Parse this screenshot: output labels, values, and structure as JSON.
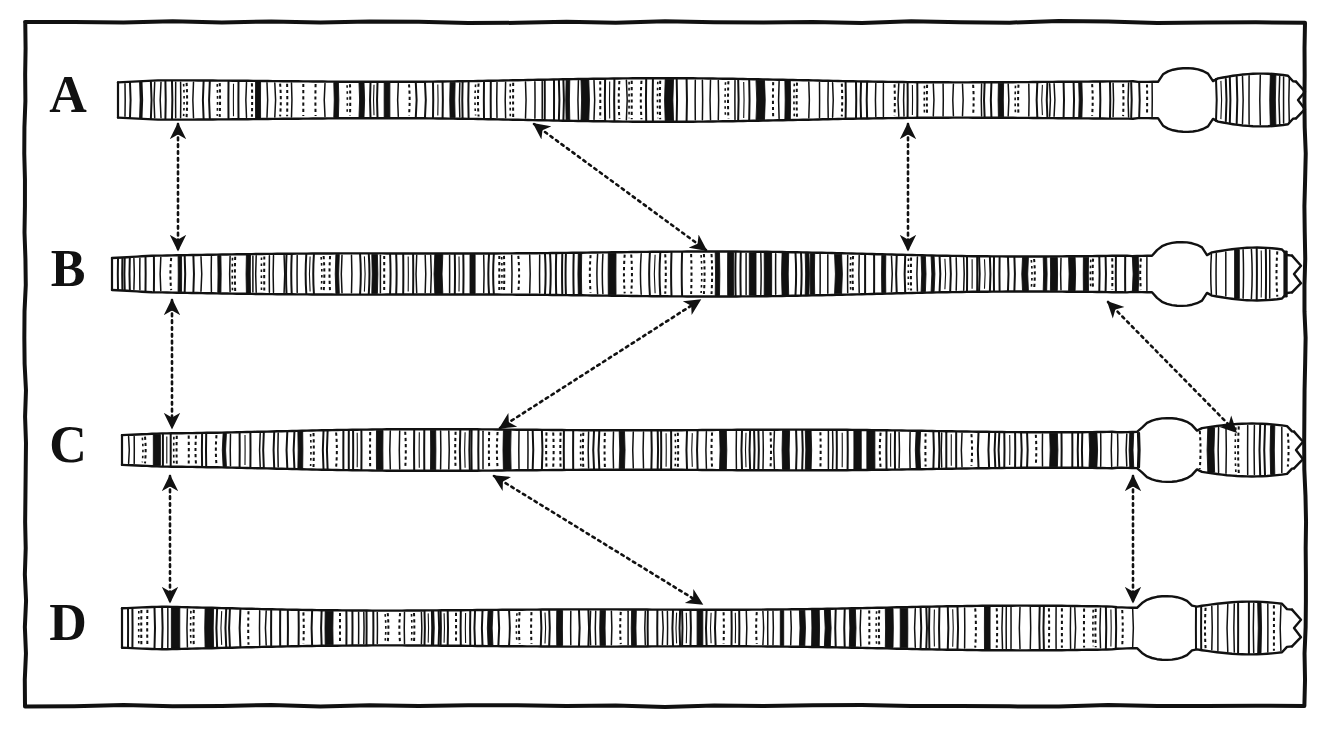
{
  "figure": {
    "background_color": "#ffffff",
    "ink_color": "#111111",
    "frame": {
      "name": "figure-border",
      "x": 25,
      "y": 22,
      "width": 1280,
      "height": 684,
      "stroke_width": 4
    }
  },
  "rows": [
    {
      "id": "A",
      "label": "A",
      "label_x": 68,
      "label_y": 100,
      "axis_y": 100,
      "x_start": 118,
      "x_end": 1296,
      "half_height": 21,
      "bulb_center": 1186,
      "bulb_radius": 27,
      "band_seed": 11
    },
    {
      "id": "B",
      "label": "B",
      "label_x": 68,
      "label_y": 274,
      "axis_y": 274,
      "x_start": 112,
      "x_end": 1292,
      "half_height": 21,
      "bulb_center": 1181,
      "bulb_radius": 26,
      "band_seed": 29
    },
    {
      "id": "C",
      "label": "C",
      "label_x": 68,
      "label_y": 450,
      "axis_y": 450,
      "x_start": 122,
      "x_end": 1294,
      "half_height": 21,
      "bulb_center": 1168,
      "bulb_radius": 27,
      "band_seed": 47
    },
    {
      "id": "D",
      "label": "D",
      "label_x": 68,
      "label_y": 628,
      "axis_y": 628,
      "x_start": 122,
      "x_end": 1292,
      "half_height": 21,
      "bulb_center": 1166,
      "bulb_radius": 27,
      "band_seed": 73
    }
  ],
  "connectors": [
    {
      "name": "connector-a-b-left",
      "kind": "vertical-double-arrow",
      "from_row": "A",
      "to_row": "B",
      "x1": 178,
      "y1": 124,
      "x2": 178,
      "y2": 250,
      "heads": "both"
    },
    {
      "name": "connector-b-c-left",
      "kind": "vertical-double-arrow",
      "from_row": "B",
      "to_row": "C",
      "x1": 172,
      "y1": 300,
      "x2": 172,
      "y2": 428,
      "heads": "both"
    },
    {
      "name": "connector-c-d-left",
      "kind": "vertical-double-arrow",
      "from_row": "C",
      "to_row": "D",
      "x1": 170,
      "y1": 476,
      "x2": 170,
      "y2": 602,
      "heads": "both"
    },
    {
      "name": "connector-a-b-right",
      "kind": "vertical-double-arrow",
      "from_row": "A",
      "to_row": "B",
      "x1": 908,
      "y1": 124,
      "x2": 908,
      "y2": 250,
      "heads": "both"
    },
    {
      "name": "connector-c-d-right",
      "kind": "vertical-double-arrow",
      "from_row": "C",
      "to_row": "D",
      "x1": 1133,
      "y1": 476,
      "x2": 1133,
      "y2": 602,
      "heads": "both"
    },
    {
      "name": "connector-a-b-diagonal",
      "kind": "diagonal-double-arrow",
      "from_row": "A",
      "to_row": "B",
      "x1": 534,
      "y1": 124,
      "x2": 706,
      "y2": 250,
      "heads": "both"
    },
    {
      "name": "connector-b-c-diagonal",
      "kind": "diagonal-double-arrow",
      "from_row": "C",
      "to_row": "B",
      "x1": 500,
      "y1": 428,
      "x2": 700,
      "y2": 300,
      "heads": "both"
    },
    {
      "name": "connector-b-c-diagonal-right",
      "kind": "diagonal-double-arrow",
      "from_row": "B",
      "to_row": "C",
      "x1": 1108,
      "y1": 302,
      "x2": 1236,
      "y2": 432,
      "heads": "both"
    },
    {
      "name": "connector-c-d-diagonal",
      "kind": "diagonal-double-arrow",
      "from_row": "C",
      "to_row": "D",
      "x1": 494,
      "y1": 476,
      "x2": 702,
      "y2": 604,
      "heads": "both"
    }
  ],
  "legend_notes": {
    "band_types": [
      "solid-dark-band",
      "outlined-band",
      "dashed-faint-band",
      "thin-line-band"
    ],
    "arrow_style": "dotted",
    "feature_right_end": "terminal bulb followed by tapered tip segment"
  }
}
